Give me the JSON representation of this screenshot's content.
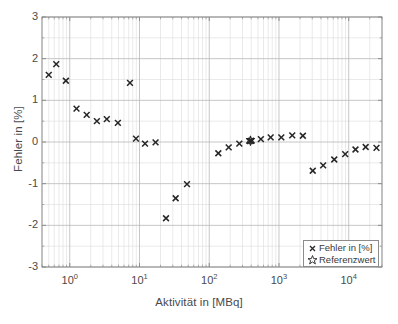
{
  "chart_data": {
    "type": "scatter",
    "title": "",
    "xlabel": "Aktivität in [MBq]",
    "ylabel": "Fehler in [%]",
    "xscale": "log",
    "yscale": "linear",
    "xlim": [
      0.4,
      30000
    ],
    "ylim": [
      -3,
      3
    ],
    "grid": true,
    "minor_grid": true,
    "xticks": [
      1,
      10,
      100,
      1000,
      10000
    ],
    "xtick_labels": [
      "10 0",
      "10 1",
      "10 2",
      "10 3",
      "10 4"
    ],
    "xtick_mantissa": [
      "10",
      "10",
      "10",
      "10",
      "10"
    ],
    "xtick_exponent": [
      "0",
      "1",
      "2",
      "3",
      "4"
    ],
    "yticks": [
      3,
      2,
      1,
      0,
      -1,
      -2,
      -3
    ],
    "ytick_labels": [
      "3",
      "2",
      "1",
      "0",
      "-1",
      "-2",
      "-3"
    ],
    "legend_position": "lower right",
    "series": [
      {
        "name": "Fehler in [%]",
        "marker": "x",
        "color": "#262626",
        "points": [
          {
            "x": 0.5,
            "y": 1.61
          },
          {
            "x": 0.64,
            "y": 1.87
          },
          {
            "x": 0.88,
            "y": 1.47
          },
          {
            "x": 1.25,
            "y": 0.8
          },
          {
            "x": 1.75,
            "y": 0.65
          },
          {
            "x": 2.45,
            "y": 0.5
          },
          {
            "x": 3.4,
            "y": 0.55
          },
          {
            "x": 4.9,
            "y": 0.46
          },
          {
            "x": 7.3,
            "y": 1.42
          },
          {
            "x": 8.9,
            "y": 0.08
          },
          {
            "x": 12.0,
            "y": -0.04
          },
          {
            "x": 17.0,
            "y": -0.01
          },
          {
            "x": 24.0,
            "y": -1.83
          },
          {
            "x": 33.0,
            "y": -1.35
          },
          {
            "x": 48.0,
            "y": -1.01
          },
          {
            "x": 135.0,
            "y": -0.27
          },
          {
            "x": 190.0,
            "y": -0.13
          },
          {
            "x": 270.0,
            "y": -0.04
          },
          {
            "x": 380.0,
            "y": 0.02
          },
          {
            "x": 400.0,
            "y": 0.03
          },
          {
            "x": 550.0,
            "y": 0.07
          },
          {
            "x": 760.0,
            "y": 0.11
          },
          {
            "x": 1080.0,
            "y": 0.11
          },
          {
            "x": 1550.0,
            "y": 0.16
          },
          {
            "x": 2200.0,
            "y": 0.15
          },
          {
            "x": 3050.0,
            "y": -0.69
          },
          {
            "x": 4300.0,
            "y": -0.56
          },
          {
            "x": 6200.0,
            "y": -0.42
          },
          {
            "x": 8900.0,
            "y": -0.29
          },
          {
            "x": 12500.0,
            "y": -0.18
          },
          {
            "x": 17500.0,
            "y": -0.12
          },
          {
            "x": 25000.0,
            "y": -0.14
          }
        ]
      },
      {
        "name": "Referenzwert",
        "marker": "hexagram",
        "color": "#262626",
        "points": [
          {
            "x": 390.0,
            "y": 0.03
          }
        ]
      }
    ]
  },
  "legend": {
    "items": [
      {
        "label": "Fehler in [%]",
        "marker": "x"
      },
      {
        "label": "Referenzwert",
        "marker": "hexagram"
      }
    ]
  },
  "colors": {
    "axis": "#8c8c8c",
    "grid_major": "#b8b8b8",
    "grid_minor": "#dcdcdc",
    "marker": "#262626",
    "text": "#4a4a4a",
    "background": "#ffffff"
  }
}
